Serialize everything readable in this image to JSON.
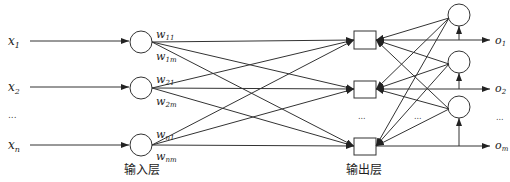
{
  "diagram": {
    "line_color": "#333333",
    "inputs": [
      {
        "base": "x",
        "sub": "1"
      },
      {
        "base": "x",
        "sub": "2"
      },
      {
        "base": "...",
        "sub": ""
      },
      {
        "base": "x",
        "sub": "n"
      }
    ],
    "weights": [
      {
        "base": "w",
        "sub": "11"
      },
      {
        "base": "w",
        "sub": "1m"
      },
      {
        "base": "w",
        "sub": "21"
      },
      {
        "base": "w",
        "sub": "2m"
      },
      {
        "base": "w",
        "sub": "n1"
      },
      {
        "base": "w",
        "sub": "nm"
      }
    ],
    "outputs": [
      {
        "base": "o",
        "sub": "1"
      },
      {
        "base": "o",
        "sub": "2"
      },
      {
        "base": "...",
        "sub": ""
      },
      {
        "base": "o",
        "sub": "m"
      }
    ],
    "layer_labels": {
      "input": "输入层",
      "output": "输出层"
    },
    "ellipsis": "..."
  }
}
